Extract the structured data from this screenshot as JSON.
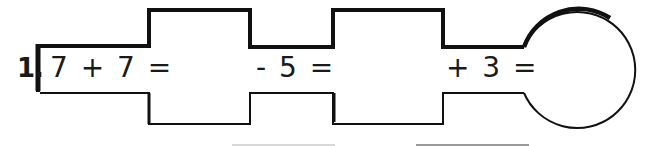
{
  "worksheet": {
    "problem_number": "1.",
    "steps": [
      {
        "expression": "7 + 7 ="
      },
      {
        "expression": "- 5 ="
      },
      {
        "expression": "+ 3 ="
      }
    ],
    "final_answer_shape": "circle",
    "answer_boxes": 2,
    "colors": {
      "outline": "#111111",
      "background": "#ffffff"
    }
  }
}
